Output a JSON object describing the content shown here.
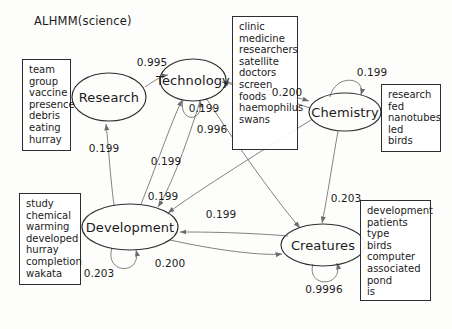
{
  "title": "ALHMM(science)",
  "diagram": {
    "type": "hmm-state-transition-graph",
    "states": [
      {
        "id": "research",
        "label": "Research",
        "cx": 109,
        "cy": 97,
        "rx": 37,
        "ry": 24
      },
      {
        "id": "technology",
        "label": "Technology",
        "cx": 193,
        "cy": 80,
        "rx": 33,
        "ry": 21
      },
      {
        "id": "chemistry",
        "label": "Chemistry",
        "cx": 345,
        "cy": 112,
        "rx": 36,
        "ry": 19
      },
      {
        "id": "development",
        "label": "Development",
        "cx": 130,
        "cy": 227,
        "rx": 48,
        "ry": 23
      },
      {
        "id": "creatures",
        "label": "Creatures",
        "cx": 323,
        "cy": 245,
        "rx": 42,
        "ry": 21
      }
    ],
    "emission_boxes": [
      {
        "id": "research-words",
        "words": [
          "team",
          "group",
          "vaccine",
          "presence",
          "debris",
          "eating",
          "hurray"
        ],
        "x": 22,
        "y": 59,
        "w": 49,
        "h": 92
      },
      {
        "id": "technology-words",
        "words": [
          "clinic",
          "medicine",
          "researchers",
          "satellite",
          "doctors",
          "screen",
          "foods",
          "haemophilus",
          "swans"
        ],
        "x": 232,
        "y": 16,
        "w": 66,
        "h": 134
      },
      {
        "id": "chemistry-words",
        "words": [
          "research",
          "fed",
          "nanotubes",
          "led",
          "birds"
        ],
        "x": 381,
        "y": 84,
        "w": 60,
        "h": 68
      },
      {
        "id": "development-words",
        "words": [
          "study",
          "chemical",
          "warming",
          "developed",
          "hurray",
          "completion",
          "wakata"
        ],
        "x": 19,
        "y": 193,
        "w": 62,
        "h": 92
      },
      {
        "id": "creatures-words",
        "words": [
          "development",
          "patients",
          "type",
          "birds",
          "computer",
          "associated",
          "pond",
          "is"
        ],
        "x": 360,
        "y": 200,
        "w": 71,
        "h": 101
      }
    ],
    "transitions": [
      {
        "id": "research-to-technology",
        "from": "research",
        "to": "technology",
        "weight": "0.995",
        "lx": 152,
        "ly": 62
      },
      {
        "id": "technology-self",
        "from": "technology",
        "to": "technology",
        "weight": "0.996",
        "lx": 212,
        "ly": 129
      },
      {
        "id": "technology-to-development",
        "from": "technology",
        "to": "development",
        "weight": "0.199",
        "lx": 204,
        "ly": 108
      },
      {
        "id": "development-to-research",
        "from": "development",
        "to": "research",
        "weight": "0.199",
        "lx": 104,
        "ly": 148
      },
      {
        "id": "development-to-technology",
        "from": "development",
        "to": "technology",
        "weight": "0.199",
        "lx": 166,
        "ly": 161
      },
      {
        "id": "chemistry-to-development",
        "from": "chemistry",
        "to": "development",
        "weight": "0.199",
        "lx": 163,
        "ly": 196
      },
      {
        "id": "creatures-to-development",
        "from": "creatures",
        "to": "development",
        "weight": "0.199",
        "lx": 221,
        "ly": 214
      },
      {
        "id": "technology-to-chemistry",
        "from": "technology",
        "to": "chemistry",
        "weight": "0.200",
        "lx": 287,
        "ly": 92
      },
      {
        "id": "chemistry-self",
        "from": "chemistry",
        "to": "chemistry",
        "weight": "0.199",
        "lx": 372,
        "ly": 72
      },
      {
        "id": "development-self",
        "from": "development",
        "to": "development",
        "weight": "0.203",
        "lx": 99,
        "ly": 273
      },
      {
        "id": "development-to-creatures",
        "from": "development",
        "to": "creatures",
        "weight": "0.200",
        "lx": 170,
        "ly": 263
      },
      {
        "id": "chemistry-to-creatures",
        "from": "chemistry",
        "to": "creatures",
        "weight": "0.203",
        "lx": 346,
        "ly": 198
      },
      {
        "id": "creatures-self",
        "from": "creatures",
        "to": "creatures",
        "weight": "0.9996",
        "lx": 324,
        "ly": 289
      }
    ]
  },
  "colors": {
    "stroke": "#2e2e2e",
    "edge": "#6b6b6b",
    "text": "#1b1b1b",
    "background": "#fdfdfc"
  }
}
